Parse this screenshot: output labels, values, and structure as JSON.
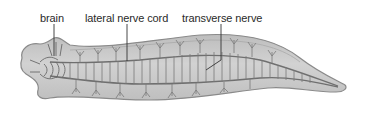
{
  "figure": {
    "labels": [
      {
        "id": "brain",
        "text": "brain"
      },
      {
        "id": "lateral-nerve-cord",
        "text": "lateral nerve cord"
      },
      {
        "id": "transverse-nerve",
        "text": "transverse nerve"
      }
    ]
  },
  "colors": {
    "body_fill": "#c9c9c9",
    "body_edge": "#8a8a8a",
    "nerve": "#6f6f6f",
    "leader_line": "#333333",
    "label_text": "#2a2a2a"
  }
}
